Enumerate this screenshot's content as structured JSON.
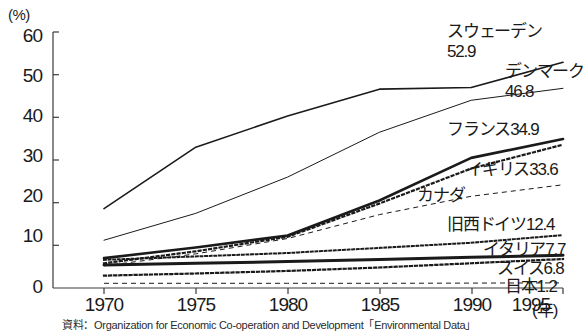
{
  "axes": {
    "unit_label": "(%)",
    "y_ticks": [
      "60",
      "50",
      "40",
      "30",
      "20",
      "10",
      "0"
    ],
    "x_ticks": [
      "1970",
      "1975",
      "1980",
      "1985",
      "1990",
      "1995"
    ],
    "x_unit": "(年)"
  },
  "labels": {
    "sweden_name": "スウェーデン",
    "sweden_value": "52.9",
    "denmark_name": "デンマーク",
    "denmark_value": "46.8",
    "france": "フランス34.9",
    "uk": "イギリス33.6",
    "canada": "カナダ",
    "west_germany": "旧西ドイツ12.4",
    "italy": "イタリア7.7",
    "switzerland": "スイス6.8",
    "japan": "日本1.2"
  },
  "caption": "資料：Organization for Economic Co-operation and Development「Environmental Data」",
  "chart_data": {
    "type": "line",
    "title": "",
    "xlabel": "(年)",
    "ylabel": "(%)",
    "xlim": [
      1970,
      1995
    ],
    "ylim": [
      0,
      60
    ],
    "grid": false,
    "legend": "inline-right-labels",
    "x": [
      1970,
      1975,
      1980,
      1985,
      1990,
      1995
    ],
    "series": [
      {
        "name": "スウェーデン",
        "label": "スウェーデン 52.9",
        "end_value": 52.9,
        "style": "solid",
        "width": 1.6,
        "values": [
          18.6,
          33.0,
          40.3,
          46.6,
          47.0,
          52.9
        ]
      },
      {
        "name": "デンマーク",
        "label": "デンマーク 46.8",
        "end_value": 46.8,
        "style": "solid",
        "width": 1.0,
        "values": [
          11.2,
          17.5,
          26.0,
          36.5,
          44.0,
          46.8
        ]
      },
      {
        "name": "フランス",
        "label": "フランス34.9",
        "end_value": 34.9,
        "style": "solid",
        "width": 2.6,
        "values": [
          7.0,
          9.5,
          12.3,
          20.5,
          30.5,
          34.9
        ]
      },
      {
        "name": "イギリス",
        "label": "イギリス33.6",
        "end_value": 33.6,
        "style": "dotted",
        "width": 2.2,
        "values": [
          5.8,
          8.6,
          12.0,
          19.8,
          28.0,
          33.6
        ]
      },
      {
        "name": "カナダ",
        "label": "カナダ",
        "end_value": null,
        "style": "dashed",
        "width": 1.0,
        "values": [
          5.2,
          8.0,
          11.6,
          17.2,
          21.5,
          24.2
        ]
      },
      {
        "name": "旧西ドイツ",
        "label": "旧西ドイツ12.4",
        "end_value": 12.4,
        "style": "dotted-square",
        "width": 2.0,
        "values": [
          6.6,
          7.4,
          8.2,
          9.4,
          10.6,
          12.4
        ]
      },
      {
        "name": "イタリア",
        "label": "イタリア7.7",
        "end_value": 7.7,
        "style": "solid",
        "width": 3.0,
        "values": [
          5.4,
          5.8,
          6.2,
          6.7,
          7.2,
          7.7
        ]
      },
      {
        "name": "スイス",
        "label": "スイス6.8",
        "end_value": 6.8,
        "style": "dotted-square",
        "width": 2.2,
        "values": [
          2.9,
          3.4,
          4.0,
          4.8,
          5.8,
          6.8
        ]
      },
      {
        "name": "日本",
        "label": "日本1.2",
        "end_value": 1.2,
        "style": "dashed",
        "width": 1.0,
        "values": [
          1.1,
          1.1,
          1.1,
          1.1,
          1.15,
          1.2
        ]
      }
    ]
  }
}
